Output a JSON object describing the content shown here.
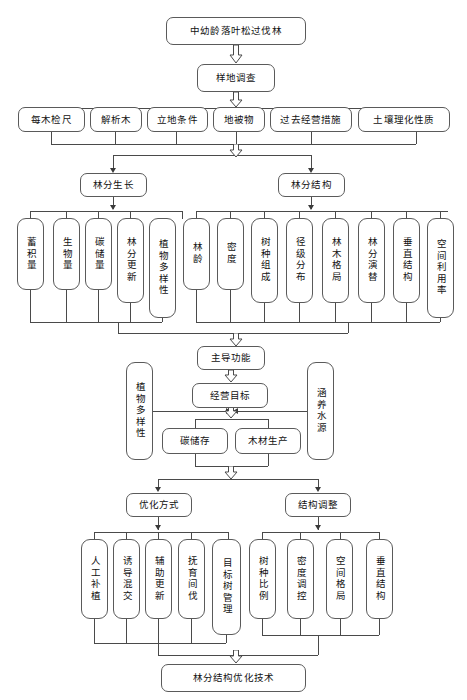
{
  "diagram": {
    "title_node": "中幼龄落叶松过伐林",
    "survey_node": "样地调查",
    "survey_items": [
      "每木检尺",
      "解析木",
      "立地条件",
      "地被物",
      "过去经营措施",
      "土壤理化性质"
    ],
    "branch_growth": "林分生长",
    "branch_structure": "林分结构",
    "growth_items": [
      "蓄积量",
      "生物量",
      "碳储量",
      "林分更新",
      "植物多样性"
    ],
    "structure_items": [
      "林龄",
      "密度",
      "树种组成",
      "径级分布",
      "林木格局",
      "林分演替",
      "垂直结构",
      "空间利用率"
    ],
    "dominant_function": "主导功能",
    "management_goal": "经营目标",
    "side_left": "植物多样性",
    "side_right": "涵养水源",
    "goal_items": [
      "碳储存",
      "木材生产"
    ],
    "optimize_method": "优化方式",
    "structure_adjust": "结构调整",
    "optimize_items": [
      "人工补植",
      "诱导混交",
      "辅助更新",
      "抚育间伐",
      "目标树管理"
    ],
    "adjust_items": [
      "树种比例",
      "密度调控",
      "空间格局",
      "垂直结构"
    ],
    "final_node": "林分结构优化技术"
  }
}
